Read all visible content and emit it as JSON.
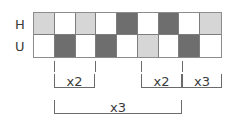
{
  "figure": {
    "type": "sequence-alignment-diagram",
    "colors": {
      "white": "#ffffff",
      "light_gray": "#d6d6d6",
      "dark_gray": "#6e6e6e",
      "line": "#6b6b6b",
      "text": "#3a3a3a"
    }
  },
  "rows": [
    {
      "label": "H",
      "cells": [
        "light",
        "white",
        "light",
        "white",
        "dark",
        "white",
        "dark",
        "white",
        "light"
      ]
    },
    {
      "label": "U",
      "cells": [
        "white",
        "dark",
        "white",
        "dark",
        "white",
        "light",
        "white",
        "dark",
        "white"
      ]
    }
  ],
  "ticks": [
    {
      "name": "tick-1",
      "x": 54
    },
    {
      "name": "tick-2",
      "x": 95
    },
    {
      "name": "tick-3",
      "x": 141
    },
    {
      "name": "tick-4",
      "x": 182
    }
  ],
  "brackets": [
    {
      "name": "bracket-x2-left",
      "label": "x2",
      "left": 54,
      "right": 95,
      "row": "upper"
    },
    {
      "name": "bracket-x2-right",
      "label": "x2",
      "left": 141,
      "right": 182,
      "row": "upper"
    },
    {
      "name": "bracket-x3-right",
      "label": "x3",
      "left": 182,
      "right": 222,
      "row": "upper"
    },
    {
      "name": "bracket-x3-span",
      "label": "x3",
      "left": 54,
      "right": 182,
      "row": "lower"
    }
  ]
}
